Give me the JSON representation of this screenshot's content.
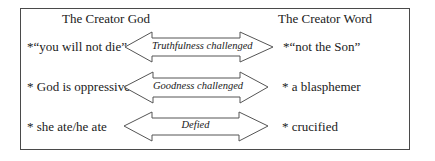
{
  "diagram": {
    "left_column": {
      "heading": "The Creator God",
      "items": [
        "*“you will not die”",
        "* God is oppressive",
        "* she ate/he ate"
      ]
    },
    "right_column": {
      "heading": "The Creator Word",
      "items": [
        "*“not the Son”",
        "* a blasphemer",
        "* crucified"
      ]
    },
    "arrows": [
      {
        "label": "Truthfulness challenged",
        "type": "double-headed"
      },
      {
        "label": "Goodness challenged",
        "type": "double-headed"
      },
      {
        "label": "Defied",
        "type": "double-headed"
      }
    ],
    "colors": {
      "border": "#4a4a4a",
      "arrow_stroke": "#555555",
      "text": "#1a1a1a",
      "background": "#ffffff"
    }
  }
}
